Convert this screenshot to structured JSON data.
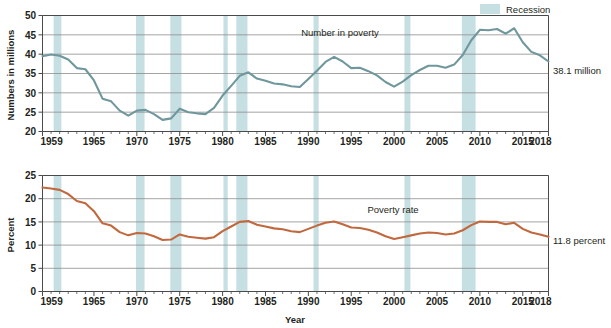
{
  "legend": {
    "position": "top-right",
    "items": [
      {
        "label": "Recession",
        "color": "#c6dfe2",
        "type": "band"
      }
    ]
  },
  "chart_data": [
    {
      "id": "number-in-poverty",
      "type": "line",
      "title": "",
      "series_label": "Number in poverty",
      "end_label": "38.1 million",
      "xlabel": "",
      "ylabel": "Numbers in millions",
      "ylim": [
        20,
        50
      ],
      "yticks": [
        20,
        25,
        30,
        35,
        40,
        45,
        50
      ],
      "xlim": [
        1959,
        2018
      ],
      "xticks": [
        1959,
        1965,
        1970,
        1975,
        1980,
        1985,
        1990,
        1995,
        2000,
        2005,
        2010,
        2015,
        2018
      ],
      "grid": true,
      "line_color": "#6f979c",
      "x": [
        1959,
        1960,
        1961,
        1962,
        1963,
        1964,
        1965,
        1966,
        1967,
        1968,
        1969,
        1970,
        1971,
        1972,
        1973,
        1974,
        1975,
        1976,
        1977,
        1978,
        1979,
        1980,
        1981,
        1982,
        1983,
        1984,
        1985,
        1986,
        1987,
        1988,
        1989,
        1990,
        1991,
        1992,
        1993,
        1994,
        1995,
        1996,
        1997,
        1998,
        1999,
        2000,
        2001,
        2002,
        2003,
        2004,
        2005,
        2006,
        2007,
        2008,
        2009,
        2010,
        2011,
        2012,
        2013,
        2014,
        2015,
        2016,
        2017,
        2018
      ],
      "values": [
        39.5,
        39.9,
        39.6,
        38.6,
        36.4,
        36.1,
        33.2,
        28.5,
        27.8,
        25.4,
        24.1,
        25.4,
        25.6,
        24.5,
        23.0,
        23.4,
        25.9,
        25.0,
        24.7,
        24.5,
        26.1,
        29.3,
        31.8,
        34.4,
        35.3,
        33.7,
        33.1,
        32.4,
        32.2,
        31.7,
        31.5,
        33.6,
        35.7,
        38.0,
        39.3,
        38.1,
        36.4,
        36.5,
        35.6,
        34.5,
        32.8,
        31.6,
        32.9,
        34.6,
        35.9,
        37.0,
        37.0,
        36.5,
        37.3,
        39.8,
        43.6,
        46.3,
        46.2,
        46.5,
        45.3,
        46.7,
        43.1,
        40.6,
        39.7,
        38.1
      ],
      "recession_bands": [
        {
          "start": 1960.3,
          "end": 1961.2
        },
        {
          "start": 1969.9,
          "end": 1970.9
        },
        {
          "start": 1973.9,
          "end": 1975.2
        },
        {
          "start": 1980.1,
          "end": 1980.6
        },
        {
          "start": 1981.6,
          "end": 1982.9
        },
        {
          "start": 1990.6,
          "end": 1991.2
        },
        {
          "start": 2001.2,
          "end": 2001.9
        },
        {
          "start": 2007.9,
          "end": 2009.5
        }
      ]
    },
    {
      "id": "poverty-rate",
      "type": "line",
      "title": "",
      "series_label": "Poverty rate",
      "end_label": "11.8 percent",
      "xlabel": "Year",
      "ylabel": "Percent",
      "ylim": [
        0,
        25
      ],
      "yticks": [
        0,
        5,
        10,
        15,
        20,
        25
      ],
      "xlim": [
        1959,
        2018
      ],
      "xticks": [
        1959,
        1965,
        1970,
        1975,
        1980,
        1985,
        1990,
        1995,
        2000,
        2005,
        2010,
        2015,
        2018
      ],
      "grid": true,
      "line_color": "#c1683e",
      "x": [
        1959,
        1960,
        1961,
        1962,
        1963,
        1964,
        1965,
        1966,
        1967,
        1968,
        1969,
        1970,
        1971,
        1972,
        1973,
        1974,
        1975,
        1976,
        1977,
        1978,
        1979,
        1980,
        1981,
        1982,
        1983,
        1984,
        1985,
        1986,
        1987,
        1988,
        1989,
        1990,
        1991,
        1992,
        1993,
        1994,
        1995,
        1996,
        1997,
        1998,
        1999,
        2000,
        2001,
        2002,
        2003,
        2004,
        2005,
        2006,
        2007,
        2008,
        2009,
        2010,
        2011,
        2012,
        2013,
        2014,
        2015,
        2016,
        2017,
        2018
      ],
      "values": [
        22.4,
        22.2,
        21.9,
        21.0,
        19.5,
        19.0,
        17.3,
        14.7,
        14.2,
        12.8,
        12.1,
        12.6,
        12.5,
        11.9,
        11.1,
        11.2,
        12.3,
        11.8,
        11.6,
        11.4,
        11.7,
        13.0,
        14.0,
        15.0,
        15.2,
        14.4,
        14.0,
        13.6,
        13.4,
        13.0,
        12.8,
        13.5,
        14.2,
        14.8,
        15.1,
        14.5,
        13.8,
        13.7,
        13.3,
        12.7,
        11.9,
        11.3,
        11.7,
        12.1,
        12.5,
        12.7,
        12.6,
        12.3,
        12.5,
        13.2,
        14.3,
        15.1,
        15.0,
        15.0,
        14.5,
        14.8,
        13.5,
        12.7,
        12.3,
        11.8
      ],
      "recession_bands": [
        {
          "start": 1960.3,
          "end": 1961.2
        },
        {
          "start": 1969.9,
          "end": 1970.9
        },
        {
          "start": 1973.9,
          "end": 1975.2
        },
        {
          "start": 1980.1,
          "end": 1980.6
        },
        {
          "start": 1981.6,
          "end": 1982.9
        },
        {
          "start": 1990.6,
          "end": 1991.2
        },
        {
          "start": 2001.2,
          "end": 2001.9
        },
        {
          "start": 2007.9,
          "end": 2009.5
        }
      ]
    }
  ],
  "colors": {
    "recession_band": "#c6dfe2",
    "top_line": "#6f979c",
    "bottom_line": "#c1683e",
    "grid": "#8d8d8d",
    "axis": "#4a4a4a",
    "text": "#231f20"
  }
}
